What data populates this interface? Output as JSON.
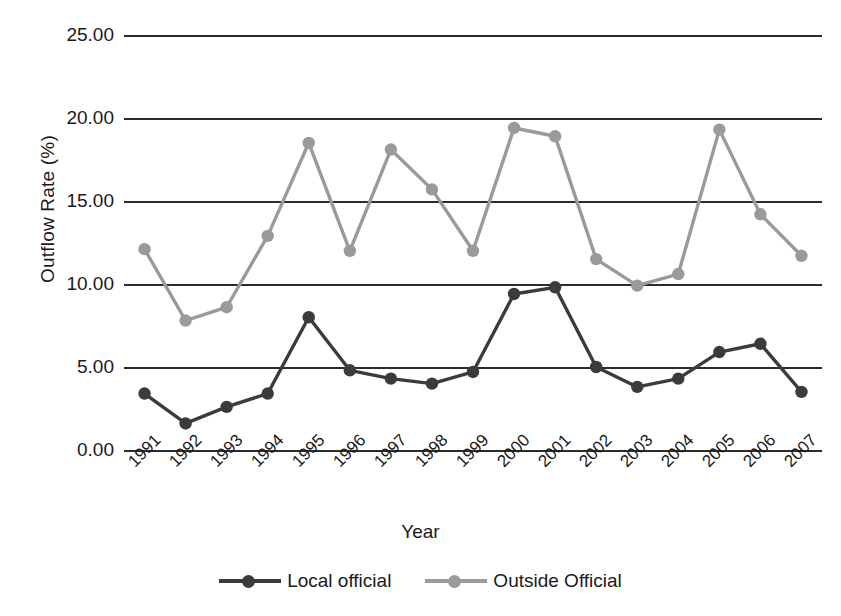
{
  "chart_data": {
    "type": "line",
    "title": "",
    "xlabel": "Year",
    "ylabel": "Outflow Rate (%)",
    "ylim": [
      0,
      25
    ],
    "ytick_labels": [
      "25.00",
      "20.00",
      "15.00",
      "10.00",
      "5.00",
      "0.00"
    ],
    "ytick_values": [
      25,
      20,
      15,
      10,
      5,
      0
    ],
    "grid": true,
    "legend_position": "bottom",
    "categories": [
      "1991",
      "1992",
      "1993",
      "1994",
      "1995",
      "1996",
      "1997",
      "1998",
      "1999",
      "2000",
      "2001",
      "2002",
      "2003",
      "2004",
      "2005",
      "2006",
      "2007"
    ],
    "series": [
      {
        "name": "Local official",
        "color": "#3b3b3b",
        "values": [
          3.4,
          1.6,
          2.6,
          3.4,
          8.0,
          4.8,
          4.3,
          4.0,
          4.7,
          9.4,
          9.8,
          5.0,
          3.8,
          4.3,
          5.9,
          6.4,
          3.5
        ]
      },
      {
        "name": "Outside Official",
        "color": "#9a9a9a",
        "values": [
          12.1,
          7.8,
          8.6,
          12.9,
          18.5,
          12.0,
          18.1,
          15.7,
          12.0,
          19.4,
          18.9,
          11.5,
          9.9,
          10.6,
          19.3,
          14.2,
          11.7
        ]
      }
    ]
  },
  "axes": {
    "x_title": "Year",
    "y_title": "Outflow Rate (%)"
  },
  "legend": {
    "items": [
      {
        "label": "Local official",
        "color": "#3b3b3b"
      },
      {
        "label": "Outside Official",
        "color": "#9a9a9a"
      }
    ]
  },
  "colors": {
    "local_official": "#3b3b3b",
    "outside_official": "#9a9a9a",
    "gridline": "#2b2b2b",
    "background": "#ffffff",
    "text": "#1a1a1a"
  }
}
